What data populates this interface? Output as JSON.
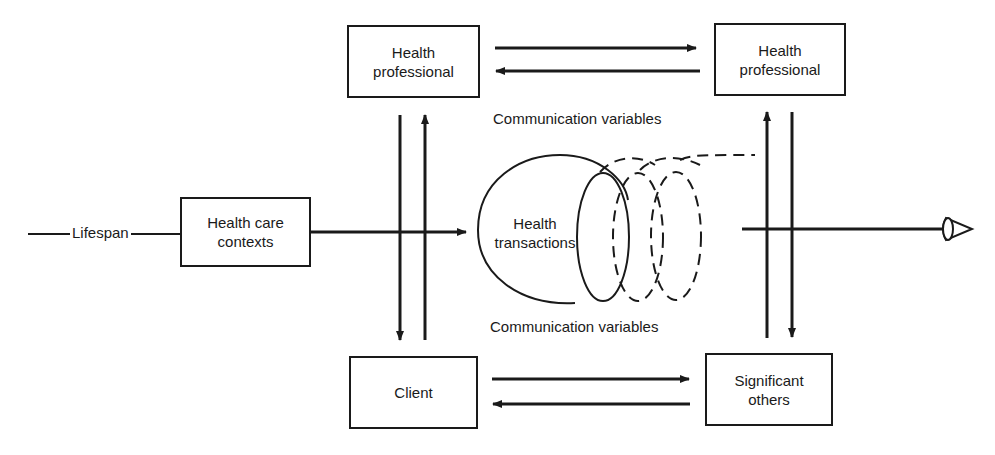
{
  "diagram": {
    "lifespan_label": "Lifespan",
    "boxes": {
      "health_care_contexts": {
        "line1": "Health care",
        "line2": "contexts"
      },
      "health_professional_left": {
        "line1": "Health",
        "line2": "professional"
      },
      "health_professional_right": {
        "line1": "Health",
        "line2": "professional"
      },
      "client": {
        "line1": "Client"
      },
      "significant_others": {
        "line1": "Significant",
        "line2": "others"
      }
    },
    "center": {
      "line1": "Health",
      "line2": "transactions"
    },
    "communication_top": "Communication variables",
    "communication_bottom": "Communication variables",
    "colors": {
      "ink": "#1a1a1a",
      "background": "#ffffff"
    }
  }
}
